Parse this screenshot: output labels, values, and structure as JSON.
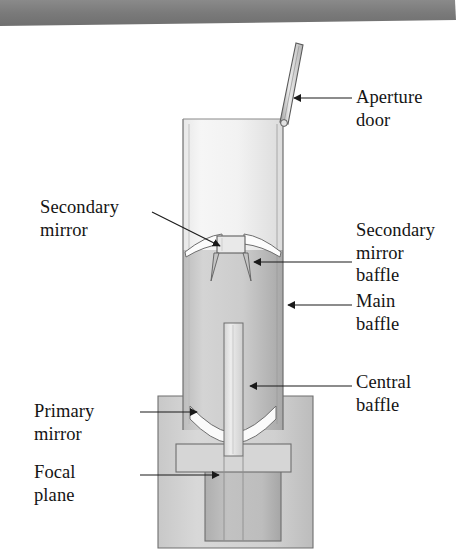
{
  "figure": {
    "kind": "technical-cutaway-diagram",
    "scan_banner": {
      "present": true,
      "color": "#7d7d7d",
      "description": "dark gray scanned page edge band across the top"
    },
    "colors": {
      "page_background": "#ffffff",
      "banner": "#7d7d7d",
      "outline": "#6b6b6b",
      "tube_upper_light": "#f2f2f2",
      "tube_upper_shade": "#dcdcdc",
      "tube_lower_light": "#d8d8d8",
      "tube_lower_shade": "#a9a9a9",
      "housing_light": "#d2d2d2",
      "housing_shade": "#c0c0c0",
      "focal_bay": "#b6b6b6",
      "mirror_white": "#fbfbfb",
      "baffle_light": "#e4e4e4",
      "label_text": "#141414",
      "leader_line": "#1a1a1a"
    },
    "parts": [
      {
        "id": "aperture-door",
        "name": "Aperture door",
        "shape": "thin hinged flat panel tilted open above the tube mouth"
      },
      {
        "id": "secondary-mirror",
        "name": "Secondary mirror",
        "shape": "convex white mirror spanning the tube, with square central housing"
      },
      {
        "id": "secondary-mirror-baffle",
        "name": "Secondary mirror baffle",
        "shape": "two thin tapered vanes descending from the secondary assembly"
      },
      {
        "id": "main-baffle",
        "name": "Main baffle",
        "shape": "cylindrical tube wall enclosing the light path"
      },
      {
        "id": "central-baffle",
        "name": "Central baffle",
        "shape": "narrow vertical tube on the optical axis above the primary"
      },
      {
        "id": "primary-mirror",
        "name": "Primary mirror",
        "shape": "concave mirror with central perforation at the tube base"
      },
      {
        "id": "focal-plane",
        "name": "Focal plane",
        "shape": "instrument bay rectangle below the primary mirror"
      }
    ]
  },
  "labels": {
    "aperture_door": {
      "text": "Aperture\ndoor",
      "side": "right",
      "x": 356,
      "y": 86
    },
    "secondary_mirror": {
      "text": "Secondary\nmirror",
      "side": "left",
      "x": 40,
      "y": 196
    },
    "secondary_mirror_baffle": {
      "text": "Secondary\nmirror\nbaffle",
      "side": "right",
      "x": 356,
      "y": 219
    },
    "main_baffle": {
      "text": "Main\nbaffle",
      "side": "right",
      "x": 356,
      "y": 290
    },
    "central_baffle": {
      "text": "Central\nbaffle",
      "side": "right",
      "x": 356,
      "y": 371
    },
    "primary_mirror": {
      "text": "Primary\nmirror",
      "side": "left",
      "x": 34,
      "y": 400
    },
    "focal_plane": {
      "text": "Focal\nplane",
      "side": "left",
      "x": 34,
      "y": 461
    }
  },
  "leaders": [
    {
      "id": "aperture-door-leader",
      "from": [
        352,
        98
      ],
      "to": [
        292,
        98
      ],
      "arrow": "left"
    },
    {
      "id": "secondary-mirror-leader",
      "from": [
        152,
        212
      ],
      "to": [
        222,
        246
      ],
      "arrow": "right"
    },
    {
      "id": "secondary-mirror-baffle-leader",
      "from": [
        352,
        262
      ],
      "to": [
        252,
        262
      ],
      "arrow": "left"
    },
    {
      "id": "main-baffle-leader",
      "from": [
        352,
        305
      ],
      "to": [
        286,
        305
      ],
      "arrow": "left"
    },
    {
      "id": "central-baffle-leader",
      "from": [
        352,
        386
      ],
      "to": [
        248,
        386
      ],
      "arrow": "left"
    },
    {
      "id": "primary-mirror-leader",
      "from": [
        140,
        412
      ],
      "to": [
        196,
        412
      ],
      "arrow": "right"
    },
    {
      "id": "focal-plane-leader",
      "from": [
        140,
        475
      ],
      "to": [
        218,
        475
      ],
      "arrow": "right"
    }
  ]
}
